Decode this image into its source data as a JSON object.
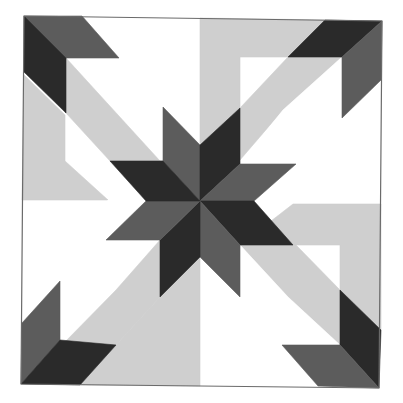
{
  "diagram": {
    "type": "quilt-block",
    "palette": {
      "background": "#ffffff",
      "white": "#ffffff",
      "light": "#cfcfcf",
      "medium": "#5c5c5c",
      "dark": "#2a2a2a",
      "outline": "#6a6a6a"
    },
    "pieces": [
      {
        "name": "bg-top-left-white",
        "fill": "white",
        "points": "86,18 200,18 200,145 163,107"
      },
      {
        "name": "bg-top-right-light",
        "fill": "light",
        "points": "200,18 325,20 288,57 240,57 240,108 200,145"
      },
      {
        "name": "bg-right-top-white",
        "fill": "white",
        "points": "381,80 381,204 293,204 331,164 342,118"
      },
      {
        "name": "bg-right-bottom-light",
        "fill": "light",
        "points": "293,204 381,204 381,330 340,290 340,245 240,245"
      },
      {
        "name": "bg-bottom-right-white",
        "fill": "white",
        "points": "200,257 240,297 288,342 318,386 200,386"
      },
      {
        "name": "bg-bottom-left-light",
        "fill": "light",
        "points": "200,257 200,386 80,385 116,345 160,297"
      },
      {
        "name": "bg-left-bottom-white",
        "fill": "white",
        "points": "22,200 108,200 70,240 60,281 22,323"
      },
      {
        "name": "bg-left-top-light",
        "fill": "light",
        "points": "24,75 65,115 65,161 108,200 22,200"
      },
      {
        "name": "band-tl-white",
        "fill": "white",
        "points": "66,58 119,58 163,107 163,161 110,161"
      },
      {
        "name": "band-tl-light",
        "fill": "light",
        "points": "66,58 110,161 163,161 148,161 66,113"
      },
      {
        "name": "band-tl-light-2",
        "fill": "light",
        "points": "66,58 66,113 110,161 160,161"
      },
      {
        "name": "band-tr-light",
        "fill": "light",
        "points": "288,57 342,57 283,110 240,160 240,108"
      },
      {
        "name": "band-tr-white",
        "fill": "white",
        "points": "342,57 342,118 296,164 240,164 283,110"
      },
      {
        "name": "band-br-light",
        "fill": "light",
        "points": "240,245 296,245 340,290 340,345 288,297"
      },
      {
        "name": "band-br-white",
        "fill": "white",
        "points": "240,245 288,297 340,345 282,345 240,300"
      },
      {
        "name": "band-bl-white",
        "fill": "white",
        "points": "108,200 160,240 116,290 60,340 60,281"
      },
      {
        "name": "band-bl-light",
        "fill": "light",
        "points": "160,240 160,297 116,345 62,345 116,290"
      },
      {
        "name": "edge-tl-medium",
        "fill": "medium",
        "points": "24,16 82,16 119,58 66,58"
      },
      {
        "name": "edge-tl-dark",
        "fill": "dark",
        "points": "24,16 66,58 66,113 24,72"
      },
      {
        "name": "edge-tr-dark",
        "fill": "dark",
        "points": "325,20 382,21 342,57 288,57"
      },
      {
        "name": "edge-tr-medium",
        "fill": "medium",
        "points": "382,21 381,80 342,118 342,57"
      },
      {
        "name": "edge-br-dark",
        "fill": "dark",
        "points": "340,290 381,330 379,388 340,345"
      },
      {
        "name": "edge-br-medium",
        "fill": "medium",
        "points": "282,345 340,345 379,388 318,386"
      },
      {
        "name": "edge-bl-medium",
        "fill": "medium",
        "points": "60,281 60,340 21,384 22,323"
      },
      {
        "name": "edge-bl-dark",
        "fill": "dark",
        "points": "60,340 116,345 80,385 21,384"
      },
      {
        "name": "star-n-left",
        "fill": "medium",
        "points": "200,201 163,161 163,107 200,145"
      },
      {
        "name": "star-n-right",
        "fill": "dark",
        "points": "200,201 200,145 240,108 240,164"
      },
      {
        "name": "star-e-top",
        "fill": "medium",
        "points": "200,201 240,164 296,164 254,201"
      },
      {
        "name": "star-e-bottom",
        "fill": "dark",
        "points": "200,201 254,201 293,245 240,245"
      },
      {
        "name": "star-s-right",
        "fill": "medium",
        "points": "200,201 240,245 240,297 200,257"
      },
      {
        "name": "star-s-left",
        "fill": "dark",
        "points": "200,201 200,257 160,297 160,240"
      },
      {
        "name": "star-w-bottom",
        "fill": "medium",
        "points": "200,201 160,240 106,240 146,201"
      },
      {
        "name": "star-w-top",
        "fill": "dark",
        "points": "200,201 146,201 110,161 163,161"
      }
    ],
    "outline": {
      "points": "24,16 382,21 379,388 21,384"
    }
  }
}
